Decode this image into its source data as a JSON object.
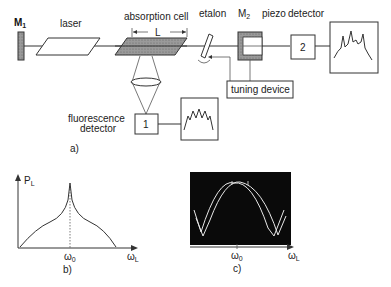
{
  "diagram_a": {
    "caption": "a)",
    "mirror1": {
      "label": "M",
      "sub": "1"
    },
    "laser": {
      "label": "laser"
    },
    "absorption_cell": {
      "label": "absorption cell",
      "length_label": "L"
    },
    "etalon": {
      "label": "etalon"
    },
    "mirror2": {
      "label": "M",
      "sub": "2",
      "piezo_label": "piezo"
    },
    "detector2": {
      "label": "detector",
      "box_label": "2"
    },
    "tuning_device": {
      "label": "tuning device"
    },
    "fluorescence_detector": {
      "line1": "fluorescence",
      "line2": "detector",
      "box_label": "1"
    }
  },
  "diagram_b": {
    "caption": "b)",
    "y_label": "P",
    "y_sub": "L",
    "x_label": "ω",
    "x_sub": "L",
    "center_label": "ω",
    "center_sub": "0"
  },
  "diagram_c": {
    "caption": "c)",
    "x_label": "ω",
    "x_sub": "L",
    "center_label": "ω",
    "center_sub": "0",
    "screen_color": "#0a0a0a",
    "trace_color": "#e8e8e8"
  }
}
